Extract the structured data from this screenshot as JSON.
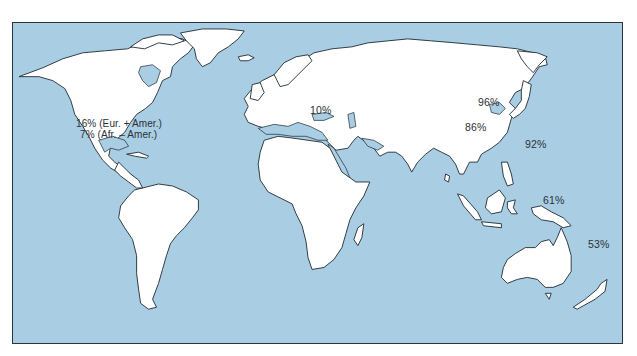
{
  "map": {
    "type": "world-outline-map",
    "colors": {
      "ocean": "#a9cde2",
      "land": "#ffffff",
      "coastline": "#1e2a33",
      "frame": "#2a3540",
      "label_text": "#2b3138"
    },
    "regions": [
      {
        "name": "North America",
        "labels": [
          "16% (Eur. + Amer.)",
          "7% (Afr. – Amer.)"
        ]
      },
      {
        "name": "Europe",
        "labels": [
          "10%"
        ]
      },
      {
        "name": "Northeast Asia",
        "labels": [
          "96%"
        ]
      },
      {
        "name": "China",
        "labels": [
          "86%"
        ]
      },
      {
        "name": "Japan",
        "labels": [
          "92%"
        ]
      },
      {
        "name": "New Guinea",
        "labels": [
          "61%"
        ]
      },
      {
        "name": "Pacific / Oceania",
        "labels": [
          "53%"
        ]
      }
    ]
  }
}
